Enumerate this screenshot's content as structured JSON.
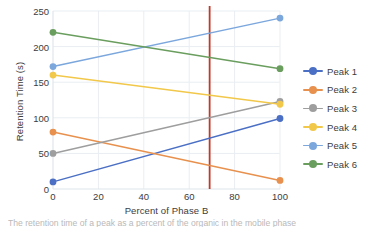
{
  "chart_data": {
    "type": "line",
    "title": "",
    "xlabel": "Percent of Phase B",
    "ylabel": "Retention Time (s)",
    "x": [
      0,
      100
    ],
    "xlim": [
      0,
      100
    ],
    "ylim": [
      0,
      250
    ],
    "xticks": [
      0,
      20,
      40,
      60,
      80,
      100
    ],
    "yticks": [
      0,
      50,
      100,
      150,
      200,
      250
    ],
    "grid": true,
    "legend_position": "right",
    "series": [
      {
        "name": "Peak 1",
        "values": [
          10,
          99
        ],
        "color": "#4a6fc4"
      },
      {
        "name": "Peak 2",
        "values": [
          80,
          12
        ],
        "color": "#e8914e"
      },
      {
        "name": "Peak 3",
        "values": [
          50,
          123
        ],
        "color": "#9e9e9e"
      },
      {
        "name": "Peak 4",
        "values": [
          160,
          119
        ],
        "color": "#f2c84b"
      },
      {
        "name": "Peak 5",
        "values": [
          172,
          240
        ],
        "color": "#7ba7dd"
      },
      {
        "name": "Peak 6",
        "values": [
          220,
          169
        ],
        "color": "#6a9e5e"
      }
    ],
    "annotations": [
      {
        "type": "vline",
        "name": "reference-line",
        "x": 69,
        "color": "#c0392b"
      }
    ]
  },
  "caption": {
    "text": "The retention time of a peak as a percent of the organic in the mobile phase"
  }
}
